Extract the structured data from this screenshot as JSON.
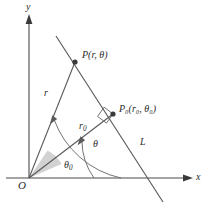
{
  "figure": {
    "background_color": "#ffffff",
    "stroke_color": "#4a4a4a",
    "text_color": "#2b2b2b",
    "wedge_fill_color": "#d2d2d2",
    "width": 211,
    "height": 212
  },
  "axes": {
    "y_label": "y",
    "x_label": "x",
    "origin_label": "O"
  },
  "points": {
    "p": {
      "label_main": "P",
      "label_args": "(r,  θ)",
      "full_label": "P(r,  θ)",
      "x": 75,
      "y": 62
    },
    "p0": {
      "label_main": "P",
      "label_sub": "0",
      "label_args": "(r",
      "full_label": "P₀(r₀, θ₀)",
      "x": 113,
      "y": 114
    },
    "origin": {
      "label": "O",
      "x": 29,
      "y": 178
    }
  },
  "segments": {
    "r_label": "r",
    "r0_label_main": "r",
    "r0_label_sub": "0",
    "line_label": "L"
  },
  "angles": {
    "theta_label": "θ",
    "theta0_label_main": "θ",
    "theta0_label_sub": "0"
  },
  "markers": {
    "right_angle": "right-angle-square",
    "p_dot": "point-marker",
    "p0_dot": "point-marker"
  }
}
